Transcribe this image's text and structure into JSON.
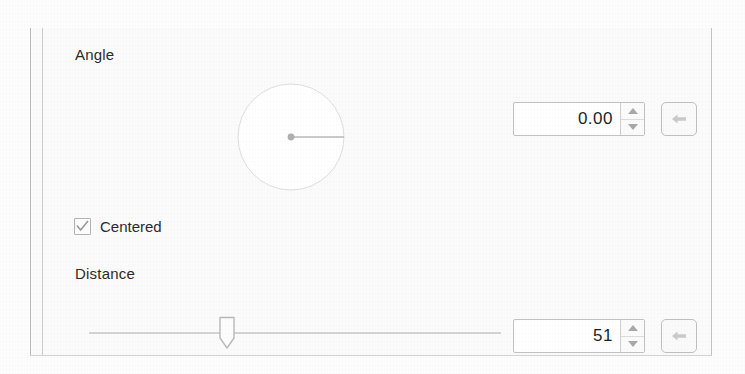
{
  "dialog": {
    "name": "motion-blur-settings-panel",
    "background_color": "#fbfbfb",
    "border_color": "#c4c4c4"
  },
  "angle": {
    "label": "Angle",
    "value": "0.00",
    "dial": {
      "icon": "angle-dial",
      "needle_degrees": 0,
      "radius_px": 54
    },
    "spinner": {
      "up_icon": "triangle-up-icon",
      "down_icon": "triangle-down-icon"
    },
    "reset": {
      "icon": "reset-arrow-icon",
      "label": ""
    }
  },
  "centered": {
    "label": "Centered",
    "checked": true,
    "check_icon": "checkmark-icon"
  },
  "distance": {
    "label": "Distance",
    "value": "51",
    "slider": {
      "handle_icon": "slider-handle-icon",
      "position_percent": 26,
      "track_color": "#d4d4d4"
    },
    "spinner": {
      "up_icon": "triangle-up-icon",
      "down_icon": "triangle-down-icon"
    },
    "reset": {
      "icon": "reset-arrow-icon",
      "label": ""
    }
  }
}
